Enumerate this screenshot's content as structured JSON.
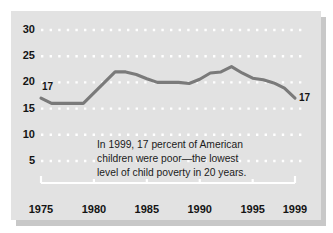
{
  "figure": {
    "background_color": "#e2e2e2",
    "shadow_color": "#c8c8c8",
    "line_color": "#7a7a7a",
    "gridline_color": "#ffffff",
    "text_color": "#141414"
  },
  "caption": {
    "line1": "In 1999, 17 percent of American",
    "line2": "children were poor—the lowest",
    "line3": "level of child poverty in 20 years."
  },
  "annotations": {
    "start_value_label": "17",
    "end_value_label": "17"
  },
  "chart_data": {
    "type": "line",
    "title": "",
    "subtitle": "",
    "xlabel": "",
    "ylabel": "",
    "xlim": [
      1975,
      1999
    ],
    "ylim": [
      0,
      32
    ],
    "grid": true,
    "grid_style": "dotted-horizontal",
    "legend": "none",
    "ytick_labels": [
      "30",
      "25",
      "20",
      "15",
      "10",
      "5"
    ],
    "yticks": [
      30,
      25,
      20,
      15,
      10,
      5
    ],
    "xtick_labels": [
      "1975",
      "1980",
      "1985",
      "1990",
      "1995",
      "1999"
    ],
    "xticks": [
      1975,
      1980,
      1985,
      1990,
      1995,
      1999
    ],
    "x": [
      1975,
      1976,
      1977,
      1978,
      1979,
      1980,
      1981,
      1982,
      1983,
      1984,
      1985,
      1986,
      1987,
      1988,
      1989,
      1990,
      1991,
      1992,
      1993,
      1994,
      1995,
      1996,
      1997,
      1998,
      1999
    ],
    "values": [
      17,
      16,
      16,
      16,
      16,
      18,
      20,
      22,
      22,
      21.5,
      20.7,
      20,
      20,
      20,
      19.8,
      20.6,
      21.8,
      22,
      23,
      21.8,
      20.8,
      20.5,
      19.9,
      18.9,
      17
    ],
    "series": [
      {
        "name": "Child poverty rate",
        "values": [
          17,
          16,
          16,
          16,
          16,
          18,
          20,
          22,
          22,
          21.5,
          20.7,
          20,
          20,
          20,
          19.8,
          20.6,
          21.8,
          22,
          23,
          21.8,
          20.8,
          20.5,
          19.9,
          18.9,
          17
        ]
      }
    ]
  }
}
